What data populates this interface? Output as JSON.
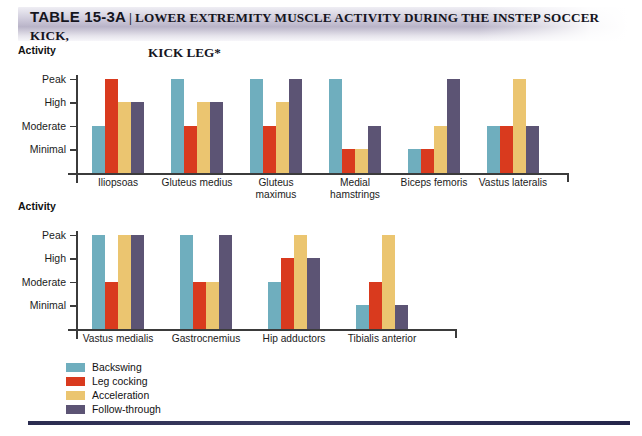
{
  "header": {
    "table_label": "TABLE 15-3A",
    "separator": "|",
    "title_line1": "LOWER EXTREMITY MUSCLE ACTIVITY DURING THE INSTEP SOCCER KICK,",
    "title_line2": "KICK LEG*"
  },
  "colors": {
    "backswing": "#6FAEBE",
    "leg_cocking": "#D93A1E",
    "acceleration": "#EBC570",
    "follow_through": "#5C5474",
    "axis": "#3B3B3B",
    "band_mid": "#B9B4C8",
    "bottom_rule": "#2B2C50"
  },
  "legend": {
    "items": [
      {
        "label": "Backswing",
        "color": "#6FAEBE"
      },
      {
        "label": "Leg cocking",
        "color": "#D93A1E"
      },
      {
        "label": "Acceleration",
        "color": "#EBC570"
      },
      {
        "label": "Follow-through",
        "color": "#5C5474"
      }
    ]
  },
  "chart_data": [
    {
      "type": "bar",
      "title": "",
      "ylabel": "Activity",
      "xlabel": "",
      "grid": false,
      "legend_position": "bottom-left",
      "ytick_labels": [
        "Minimal",
        "Moderate",
        "High",
        "Peak"
      ],
      "ylim": [
        0,
        4
      ],
      "categories": [
        "Iliopsoas",
        "Gluteus medius",
        "Gluteus maximus",
        "Medial hamstrings",
        "Biceps femoris",
        "Vastus lateralis"
      ],
      "category_lines": [
        [
          "Iliopsoas"
        ],
        [
          "Gluteus medius"
        ],
        [
          "Gluteus",
          "maximus"
        ],
        [
          "Medial",
          "hamstrings"
        ],
        [
          "Biceps femoris"
        ],
        [
          "Vastus lateralis"
        ]
      ],
      "series": [
        {
          "name": "Backswing",
          "color": "#6FAEBE",
          "values": [
            2,
            4,
            4,
            4,
            1,
            2
          ],
          "labels": [
            "Moderate",
            "Peak",
            "Peak",
            "Peak",
            "Minimal",
            "Moderate"
          ]
        },
        {
          "name": "Leg cocking",
          "color": "#D93A1E",
          "values": [
            4,
            2,
            2,
            1,
            1,
            2
          ],
          "labels": [
            "Peak",
            "Moderate",
            "Moderate",
            "Minimal",
            "Minimal",
            "Moderate"
          ]
        },
        {
          "name": "Acceleration",
          "color": "#EBC570",
          "values": [
            3,
            3,
            3,
            1,
            2,
            4
          ],
          "labels": [
            "High",
            "High",
            "High",
            "Minimal",
            "Moderate",
            "Peak"
          ]
        },
        {
          "name": "Follow-through",
          "color": "#5C5474",
          "values": [
            3,
            3,
            4,
            2,
            4,
            2
          ],
          "labels": [
            "High",
            "High",
            "Peak",
            "Moderate",
            "Peak",
            "Moderate"
          ]
        }
      ]
    },
    {
      "type": "bar",
      "title": "",
      "ylabel": "Activity",
      "xlabel": "",
      "grid": false,
      "legend_position": "bottom-left",
      "ytick_labels": [
        "Minimal",
        "Moderate",
        "High",
        "Peak"
      ],
      "ylim": [
        0,
        4
      ],
      "categories": [
        "Vastus medialis",
        "Gastrocnemius",
        "Hip adductors",
        "Tibialis anterior"
      ],
      "category_lines": [
        [
          "Vastus medialis"
        ],
        [
          "Gastrocnemius"
        ],
        [
          "Hip adductors"
        ],
        [
          "Tibialis anterior"
        ]
      ],
      "series": [
        {
          "name": "Backswing",
          "color": "#6FAEBE",
          "values": [
            4,
            4,
            2,
            1
          ],
          "labels": [
            "Peak",
            "Peak",
            "Moderate",
            "Minimal"
          ]
        },
        {
          "name": "Leg cocking",
          "color": "#D93A1E",
          "values": [
            2,
            2,
            3,
            2
          ],
          "labels": [
            "Moderate",
            "Moderate",
            "High",
            "Moderate"
          ]
        },
        {
          "name": "Acceleration",
          "color": "#EBC570",
          "values": [
            4,
            2,
            4,
            4
          ],
          "labels": [
            "Peak",
            "Moderate",
            "Peak",
            "Peak"
          ]
        },
        {
          "name": "Follow-through",
          "color": "#5C5474",
          "values": [
            4,
            4,
            3,
            1
          ],
          "labels": [
            "Peak",
            "Peak",
            "High",
            "Minimal"
          ]
        }
      ]
    }
  ]
}
